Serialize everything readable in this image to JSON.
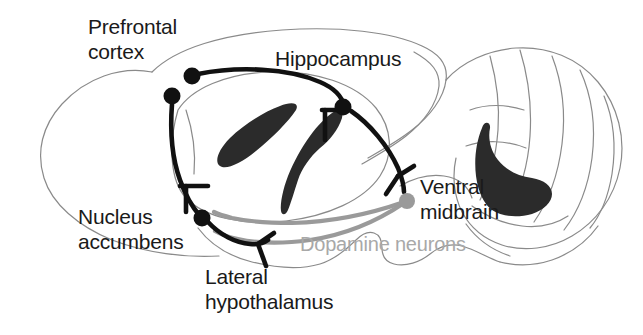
{
  "figure": {
    "kind": "sagittal-rodent-brain-circuit-diagram",
    "colors": {
      "outline": "#8a8a8a",
      "outline_dark": "#6f6f6f",
      "structure_fill": "#2b2b2b",
      "pathway_excitatory": "#111111",
      "pathway_dopamine": "#9a9a9a",
      "label_text": "#1a1a1a",
      "label_text_dim": "#a8a8a8",
      "background": "#ffffff"
    }
  },
  "labels": {
    "prefrontal_cortex": "Prefrontal\ncortex",
    "hippocampus": "Hippocampus",
    "ventral_midbrain": "Ventral\nmidbrain",
    "dopamine_neurons": "Dopamine neurons",
    "nucleus_accumbens": "Nucleus\naccumbens",
    "lateral_hypothalamus": "Lateral\nhypothalamus"
  },
  "nodes": [
    {
      "id": "prefrontal-cortex",
      "label": "Prefrontal cortex",
      "x": 172,
      "y": 96,
      "r": 8.5,
      "color": "#111111"
    },
    {
      "id": "hippocampus-source",
      "label": "Hippocampus",
      "x": 192,
      "y": 76,
      "r": 8.5,
      "color": "#111111"
    },
    {
      "id": "hippocampus-target",
      "label": "Hippocampus",
      "x": 343,
      "y": 107,
      "r": 8.5,
      "color": "#111111"
    },
    {
      "id": "nucleus-accumbens",
      "label": "Nucleus accumbens",
      "x": 202,
      "y": 218,
      "r": 8.5,
      "color": "#111111"
    },
    {
      "id": "ventral-midbrain",
      "label": "Ventral midbrain",
      "x": 407,
      "y": 201,
      "r": 8.0,
      "color": "#9a9a9a"
    }
  ],
  "pathways": [
    {
      "id": "pfc-to-hippocampus",
      "type": "excitatory",
      "color": "#111111"
    },
    {
      "id": "pfc-to-accumbens",
      "type": "excitatory",
      "color": "#111111"
    },
    {
      "id": "hippocampus-to-midbrain",
      "type": "excitatory",
      "color": "#111111"
    },
    {
      "id": "accumbens-to-hypothalamus",
      "type": "excitatory",
      "color": "#111111"
    },
    {
      "id": "midbrain-to-accumbens-dopamine",
      "type": "dopamine",
      "color": "#9a9a9a"
    }
  ]
}
